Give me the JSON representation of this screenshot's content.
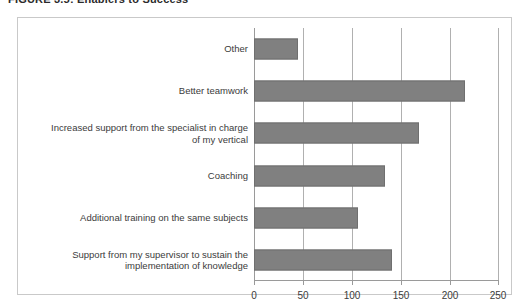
{
  "figure": {
    "caption": "FIGURE 3.5: Enablers to Success"
  },
  "chart_data": {
    "type": "bar",
    "orientation": "horizontal",
    "title": "FIGURE 3.5: Enablers to Success",
    "xlabel": "",
    "ylabel": "",
    "xlim": [
      0,
      250
    ],
    "xticks": [
      "0",
      "50",
      "100",
      "150",
      "200",
      "250"
    ],
    "xtick_values": [
      0,
      50,
      100,
      150,
      200,
      250
    ],
    "grid": true,
    "legend": false,
    "bar_color": "#808080",
    "bar_border_color": "#6f6f6f",
    "plot_border_color": "#c9c9c9",
    "gridline_color": "#b0b0b0",
    "categories": [
      "Other",
      "Better teamwork",
      "Increased support from the  specialist in charge\nof my vertical",
      "Coaching",
      "Additional training on the same subjects",
      "Support from my supervisor to sustain the\nimplementation of knowledge"
    ],
    "values": [
      45,
      215,
      168,
      134,
      106,
      141
    ]
  }
}
